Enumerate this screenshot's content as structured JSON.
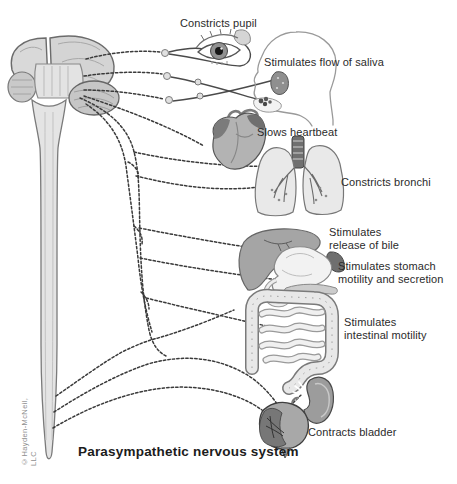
{
  "figure": {
    "title": "Parasympathetic nervous system",
    "copyright": "©Hayden-McNeil, LLC",
    "labels": {
      "pupil": "Constricts pupil",
      "saliva": "Stimulates flow of saliva",
      "heartbeat": "Slows heartbeat",
      "bronchi": "Constricts bronchi",
      "bile": "Stimulates\nrelease of bile",
      "stomach": "Stimulates stomach\nmotility and secretion",
      "intestine": "Stimulates\nintestinal motility",
      "bladder": "Contracts bladder"
    },
    "colors": {
      "nerve": "#3a3a3a",
      "organ_light": "#e9e9e9",
      "organ_mid": "#b3b3b3",
      "organ_dark": "#757575",
      "outline": "#555555",
      "label_text": "#2b2b2b"
    }
  }
}
